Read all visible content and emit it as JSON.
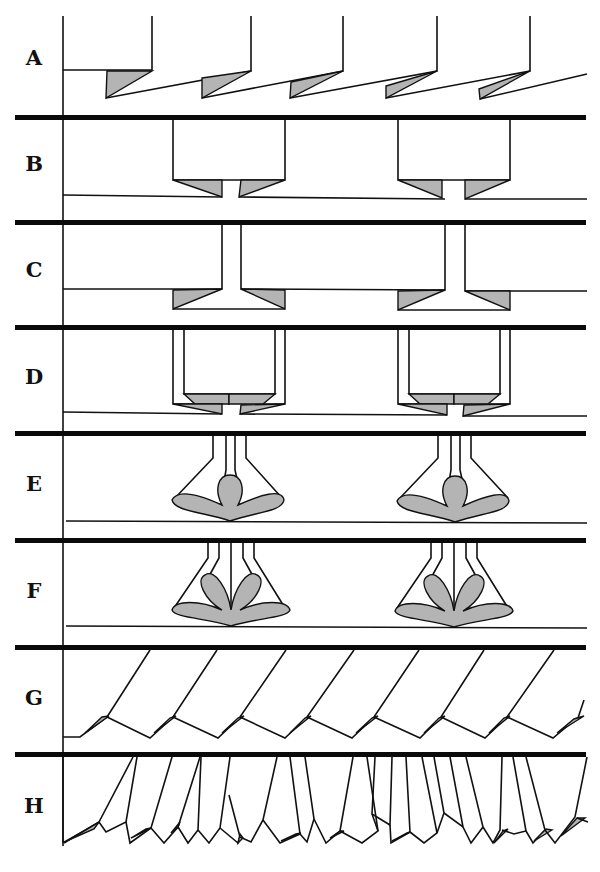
{
  "figure": {
    "panels": [
      {
        "label": "A",
        "description": "sawtooth flaps with shaded triangular tips hanging from baseline"
      },
      {
        "label": "B",
        "description": "two boxes with shaded chamfered bases and central gap"
      },
      {
        "label": "C",
        "description": "two T-shaped stems with shaded flared feet"
      },
      {
        "label": "D",
        "description": "two nested boxes with double shaded chamfers"
      },
      {
        "label": "E",
        "description": "two funnel shapes with three-petal shaded lobes"
      },
      {
        "label": "F",
        "description": "two funnel shapes with four-petal shaded lobes"
      },
      {
        "label": "G",
        "description": "regular oblique plates with shaded tips"
      },
      {
        "label": "H",
        "description": "irregular crowded oblique plates with shaded tips"
      }
    ],
    "colors": {
      "line": "#111111",
      "shade": "#b4b4b4",
      "background": "#ffffff"
    }
  }
}
